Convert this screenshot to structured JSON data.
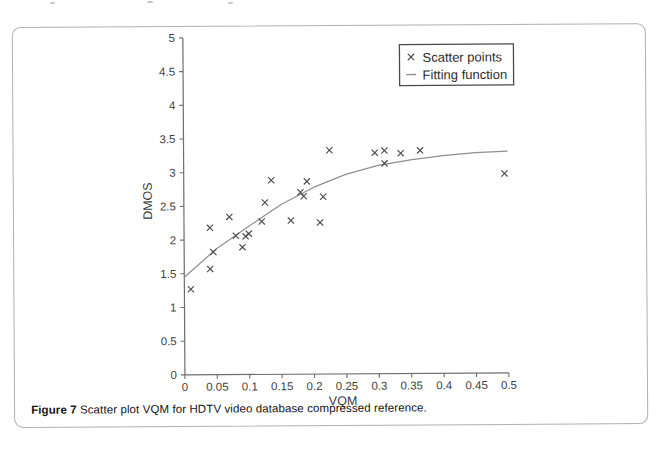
{
  "figure": {
    "caption_label": "Figure 7",
    "caption_text": " Scatter plot VQM for HDTV video database compressed reference."
  },
  "chart_data": {
    "type": "scatter",
    "title": "",
    "xlabel": "VQM",
    "ylabel": "DMOS",
    "xlim": [
      0,
      0.5
    ],
    "ylim": [
      0,
      5
    ],
    "grid": false,
    "x_ticks": {
      "values": [
        0,
        0.05,
        0.1,
        0.15,
        0.2,
        0.25,
        0.3,
        0.35,
        0.4,
        0.45,
        0.5
      ],
      "labels": [
        "0",
        "0.05",
        "0.1",
        "0.15",
        "0.2",
        "0.25",
        "0.3",
        "0.35",
        "0.4",
        "0.45",
        "0.5"
      ]
    },
    "y_ticks": {
      "values": [
        0,
        0.5,
        1,
        1.5,
        2,
        2.5,
        3,
        3.5,
        4,
        4.5,
        5
      ],
      "labels": [
        "0",
        "0.5",
        "1",
        "1.5",
        "2",
        "2.5",
        "3",
        "3.5",
        "4",
        "4.5",
        "5"
      ]
    },
    "legend": {
      "position": "top-right",
      "entries": [
        {
          "label": "Scatter points",
          "marker": "x"
        },
        {
          "label": "Fitting function",
          "marker": "line"
        }
      ]
    },
    "series": [
      {
        "name": "Scatter points",
        "type": "scatter",
        "marker": "x",
        "color": "#4d4d4d",
        "points": [
          [
            0.01,
            1.27
          ],
          [
            0.04,
            1.57
          ],
          [
            0.045,
            1.82
          ],
          [
            0.04,
            2.18
          ],
          [
            0.07,
            2.34
          ],
          [
            0.08,
            2.06
          ],
          [
            0.095,
            2.05
          ],
          [
            0.1,
            2.09
          ],
          [
            0.09,
            1.89
          ],
          [
            0.12,
            2.27
          ],
          [
            0.125,
            2.55
          ],
          [
            0.135,
            2.88
          ],
          [
            0.165,
            2.28
          ],
          [
            0.18,
            2.7
          ],
          [
            0.185,
            2.64
          ],
          [
            0.19,
            2.86
          ],
          [
            0.21,
            2.25
          ],
          [
            0.215,
            2.63
          ],
          [
            0.225,
            3.32
          ],
          [
            0.295,
            3.28
          ],
          [
            0.31,
            3.31
          ],
          [
            0.31,
            3.12
          ],
          [
            0.335,
            3.27
          ],
          [
            0.365,
            3.31
          ],
          [
            0.495,
            2.96
          ]
        ]
      },
      {
        "name": "Fitting function",
        "type": "line",
        "color": "#8f8f8f",
        "points": [
          [
            0,
            1.45
          ],
          [
            0.05,
            1.87
          ],
          [
            0.1,
            2.2
          ],
          [
            0.15,
            2.52
          ],
          [
            0.2,
            2.77
          ],
          [
            0.25,
            2.96
          ],
          [
            0.3,
            3.09
          ],
          [
            0.35,
            3.17
          ],
          [
            0.4,
            3.23
          ],
          [
            0.45,
            3.27
          ],
          [
            0.5,
            3.29
          ]
        ]
      }
    ]
  },
  "colors": {
    "axis": "#6e6e6e",
    "tick_label": "#3f3f3f",
    "axis_label": "#3a3a3a",
    "legend_border": "#4a4a4a",
    "legend_text": "#2e2e2e",
    "figure_border": "#b2b2b2",
    "scatter": "#4d4d4d",
    "fit_line": "#8f8f8f"
  }
}
